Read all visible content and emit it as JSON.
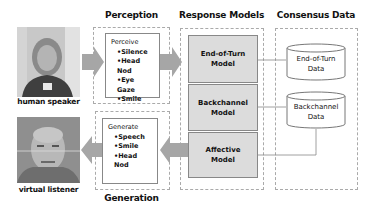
{
  "diagram": {
    "sections": {
      "perception": {
        "title": "Perception"
      },
      "generation": {
        "title": "Generation"
      },
      "response_models": {
        "title": "Response Models"
      },
      "consensus_data": {
        "title": "Consensus Data"
      }
    },
    "participants": {
      "speaker": {
        "label": "human speaker"
      },
      "listener": {
        "label": "virtual listener"
      }
    },
    "perceive": {
      "heading": "Perceive",
      "items": [
        "Silence",
        "Head Nod",
        "Eye Gaze",
        "Smile"
      ]
    },
    "generate": {
      "heading": "Generate",
      "items": [
        "Speech",
        "Smile",
        "Head Nod"
      ]
    },
    "models": [
      {
        "line1": "End-of-Turn",
        "line2": "Model"
      },
      {
        "line1": "Backchannel",
        "line2": "Model"
      },
      {
        "line1": "Affective",
        "line2": "Model"
      }
    ],
    "data_stores": [
      {
        "line1": "End-of-Turn",
        "line2": "Data"
      },
      {
        "line1": "Backchannel",
        "line2": "Data"
      }
    ],
    "colors": {
      "arrow": "#a6a6a6",
      "model_fill": "#dcdcdc",
      "border": "#888888",
      "dashed": "#aaaaaa"
    }
  }
}
